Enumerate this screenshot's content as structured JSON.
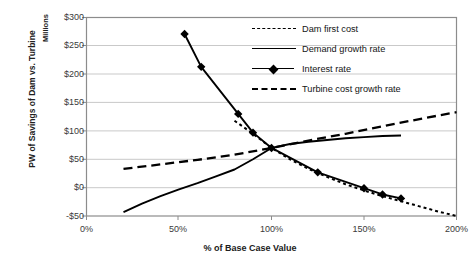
{
  "chart_data": {
    "type": "line",
    "title": "",
    "xlabel": "% of Base Case Value",
    "ylabel": "PW of Savings of Dam vs. Turbine",
    "yunits": "Millions",
    "xlim": [
      0,
      200
    ],
    "ylim": [
      -50,
      300
    ],
    "xticks": [
      "0%",
      "50%",
      "100%",
      "150%",
      "200%"
    ],
    "xtick_values": [
      0,
      50,
      100,
      150,
      200
    ],
    "yticks": [
      "-$50",
      "$0",
      "$50",
      "$100",
      "$150",
      "$200",
      "$250",
      "$300"
    ],
    "ytick_values": [
      -50,
      0,
      50,
      100,
      150,
      200,
      250,
      300
    ],
    "grid": "horizontal",
    "legend_position": "top-right",
    "series": [
      {
        "name": "Dam first cost",
        "style": "dotted",
        "marker": "none",
        "color": "#000000",
        "x": [
          80,
          90,
          100,
          110,
          120,
          130,
          140,
          150,
          160,
          170,
          180,
          190,
          200
        ],
        "y": [
          118,
          95,
          70,
          50,
          33,
          19,
          6,
          -5,
          -15,
          -24,
          -33,
          -42,
          -50
        ]
      },
      {
        "name": "Demand growth rate",
        "style": "solid",
        "marker": "none",
        "color": "#000000",
        "x": [
          20,
          30,
          40,
          50,
          60,
          70,
          80,
          90,
          100,
          110,
          120,
          130,
          140,
          150,
          160,
          170
        ],
        "y": [
          -43,
          -28,
          -15,
          -3,
          8,
          20,
          32,
          50,
          70,
          77,
          81,
          84,
          87,
          89,
          91,
          92
        ]
      },
      {
        "name": "Interest rate",
        "style": "solid",
        "marker": "diamond",
        "color": "#000000",
        "x": [
          53,
          62,
          82,
          90,
          100,
          125,
          150,
          160,
          170
        ],
        "y": [
          271,
          213,
          130,
          97,
          70,
          27,
          -1,
          -12,
          -19
        ]
      },
      {
        "name": "Turbine cost growth rate",
        "style": "dashed",
        "marker": "none",
        "color": "#000000",
        "x": [
          20,
          40,
          60,
          80,
          100,
          120,
          140,
          160,
          180,
          200
        ],
        "y": [
          33,
          41,
          49,
          58,
          70,
          83,
          95,
          108,
          121,
          133
        ]
      }
    ]
  },
  "axes": {
    "x_title": "% of Base Case Value",
    "y_title": "PW of Savings of Dam vs. Turbine",
    "y_units": "Millions"
  },
  "legend": {
    "items": [
      {
        "label": "Dam first cost",
        "key": "dotted-line-key"
      },
      {
        "label": "Demand growth rate",
        "key": "solid-line-key"
      },
      {
        "label": "Interest rate",
        "key": "diamond-marker-line-key"
      },
      {
        "label": "Turbine cost growth rate",
        "key": "dashed-line-key"
      }
    ]
  },
  "colors": {
    "plot_border": "#808080",
    "gridline": "#c8c8c8",
    "series": "#000000",
    "text": "#1a1a1a"
  }
}
